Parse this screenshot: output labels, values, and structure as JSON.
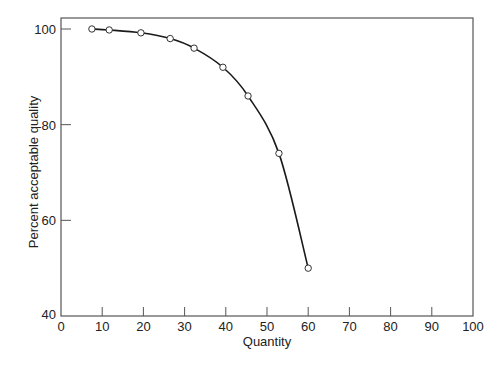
{
  "chart_data": {
    "type": "line",
    "title": "",
    "xlabel": "Quantity",
    "ylabel": "Percent acceptable quality",
    "xlim": [
      0,
      100
    ],
    "ylim": [
      40,
      100
    ],
    "xticks": [
      0,
      10,
      20,
      30,
      40,
      50,
      60,
      70,
      80,
      90,
      100
    ],
    "yticks": [
      40,
      60,
      80,
      100
    ],
    "grid": false,
    "legend": null,
    "series": [
      {
        "name": "quality curve",
        "marker": "open-circle",
        "smooth": true,
        "x": [
          7.5,
          11.7,
          19.4,
          26.5,
          32.3,
          39.3,
          45.4,
          52.9,
          60
        ],
        "y": [
          100,
          99.8,
          99.2,
          98,
          96,
          92,
          86,
          74,
          50
        ]
      }
    ]
  },
  "colors": {
    "line": "#1a1a1a",
    "axis": "#555555",
    "marker_fill": "#ffffff"
  }
}
